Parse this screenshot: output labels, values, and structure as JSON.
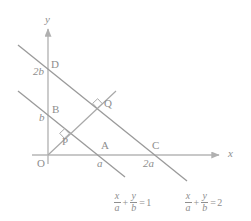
{
  "figure": {
    "type": "geometry-diagram",
    "axes": {
      "x_label": "x",
      "y_label": "y",
      "origin_label": "O",
      "x_axis": {
        "x1": 32,
        "y1": 155,
        "x2": 222,
        "y2": 155,
        "arrow": true
      },
      "y_axis": {
        "x1": 48,
        "y1": 164,
        "x2": 48,
        "y2": 26,
        "arrow": true
      }
    },
    "tick_labels": {
      "x_a": "a",
      "x_2a": "2a",
      "y_b": "b",
      "y_2b": "2b"
    },
    "points": [
      {
        "name": "O",
        "label": "O",
        "x": 48,
        "y": 155
      },
      {
        "name": "P",
        "label": "P",
        "x": 64,
        "y": 134
      },
      {
        "name": "Q",
        "label": "Q",
        "x": 104,
        "y": 103
      },
      {
        "name": "A",
        "label": "A",
        "x": 104,
        "y": 155
      },
      {
        "name": "B",
        "label": "B",
        "x": 48,
        "y": 112
      },
      {
        "name": "C",
        "label": "C",
        "x": 155,
        "y": 155
      },
      {
        "name": "D",
        "label": "D",
        "x": 48,
        "y": 67
      }
    ],
    "lines": [
      {
        "name": "line-1",
        "equation_text": "x/a + y/b = 1",
        "x1": 18,
        "y1": 91,
        "x2": 124,
        "y2": 176
      },
      {
        "name": "line-2",
        "equation_text": "x/a + y/b = 2",
        "x1": 18,
        "y1": 45,
        "x2": 186,
        "y2": 181
      },
      {
        "name": "perpendicular-from-origin",
        "x1": 48,
        "y1": 155,
        "x2": 115,
        "y2": 92
      }
    ],
    "right_angle_marks": [
      {
        "at": "P",
        "x": 64,
        "y": 134
      },
      {
        "at": "Q",
        "x": 104,
        "y": 103
      }
    ],
    "equation_1": {
      "numerator_1": "x",
      "denominator_1": "a",
      "operator": "+",
      "numerator_2": "y",
      "denominator_2": "b",
      "equals": "=",
      "value": "1"
    },
    "equation_2": {
      "numerator_1": "x",
      "denominator_1": "a",
      "operator": "+",
      "numerator_2": "y",
      "denominator_2": "b",
      "equals": "=",
      "value": "2"
    },
    "colors": {
      "line": "#9a9a9a",
      "axis": "#b0b0b0",
      "text": "#8e8e8e",
      "background": "#ffffff"
    }
  }
}
